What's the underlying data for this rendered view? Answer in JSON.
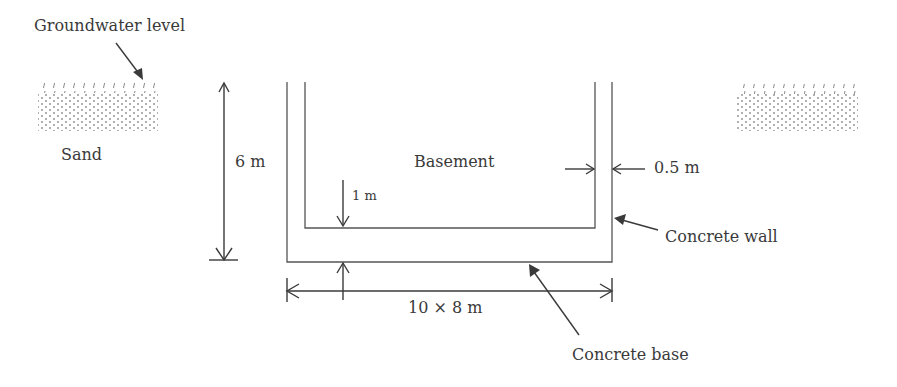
{
  "labels": {
    "groundwater": "Groundwater level",
    "sand": "Sand",
    "height": "6 m",
    "basement": "Basement",
    "wall_thickness": "0.5 m",
    "base_thickness": "1 m",
    "concrete_wall": "Concrete wall",
    "footprint": "10 × 8 m",
    "concrete_base": "Concrete base"
  },
  "colors": {
    "line": "#555555",
    "text": "#3a3a3a",
    "hatch": "#8a8a8a"
  }
}
